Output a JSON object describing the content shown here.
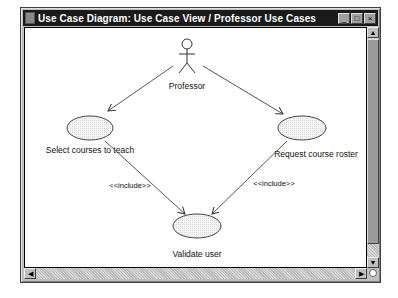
{
  "window": {
    "title": "Use Case Diagram: Use Case View / Professor Use Cases",
    "buttons": {
      "minimize": "_",
      "maximize": "□",
      "close": "×"
    }
  },
  "diagram": {
    "actor": {
      "name": "Professor"
    },
    "use_cases": [
      {
        "id": "uc1",
        "label": "Select courses to teach"
      },
      {
        "id": "uc2",
        "label": "Request course roster"
      },
      {
        "id": "uc3",
        "label": "Validate user"
      }
    ],
    "relationships": [
      {
        "from": "Professor",
        "to": "Select courses to teach",
        "type": "association"
      },
      {
        "from": "Professor",
        "to": "Request course roster",
        "type": "association"
      },
      {
        "from": "Select courses to teach",
        "to": "Validate user",
        "type": "include",
        "label": "<<include>>"
      },
      {
        "from": "Request course roster",
        "to": "Validate user",
        "type": "include",
        "label": "<<include>>"
      }
    ]
  },
  "scrollbars": {
    "up": "▲",
    "down": "▼",
    "left": "◀",
    "right": "▶"
  }
}
